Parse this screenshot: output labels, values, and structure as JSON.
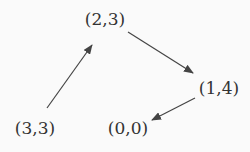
{
  "diagram": {
    "type": "directed-graph",
    "nodes": [
      {
        "id": "n1",
        "label": "(3,3)",
        "x": 35,
        "y": 128
      },
      {
        "id": "n2",
        "label": "(2,3)",
        "x": 105,
        "y": 19
      },
      {
        "id": "n3",
        "label": "(1,4)",
        "x": 219,
        "y": 88
      },
      {
        "id": "n4",
        "label": "(0,0)",
        "x": 128,
        "y": 128
      }
    ],
    "edges": [
      {
        "from": "(3,3)",
        "to": "(2,3)"
      },
      {
        "from": "(2,3)",
        "to": "(1,4)"
      },
      {
        "from": "(1,4)",
        "to": "(0,0)"
      }
    ],
    "colors": {
      "text": "#333333",
      "edge": "#444444",
      "background": "#fafafa"
    }
  }
}
